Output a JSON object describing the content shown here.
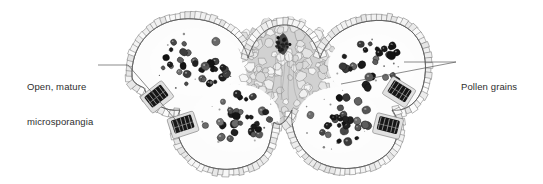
{
  "figure": {
    "type": "light-micrograph",
    "width": 543,
    "height": 184,
    "background_color": "#ffffff"
  },
  "annotations": [
    {
      "id": "open-mature-microsporangia",
      "name": "label-open-mature-microsporangia",
      "lines": [
        "Open, mature",
        "microsporangia"
      ],
      "text": "Open, mature microsporangia",
      "text_x": 27,
      "text_y": 58,
      "leader": {
        "type": "elbow",
        "points": [
          [
            98,
            65
          ],
          [
            128,
            65
          ],
          [
            181,
            126
          ]
        ],
        "color": "#5a5a5a",
        "width": 0.7
      }
    },
    {
      "id": "pollen-grains",
      "name": "label-pollen-grains",
      "lines": [
        "Pollen grains"
      ],
      "text": "Pollen grains",
      "text_x": 461,
      "text_y": 58,
      "leaders": [
        {
          "type": "line",
          "points": [
            [
              404,
              62
            ],
            [
              456,
              62
            ]
          ],
          "color": "#5a5a5a",
          "width": 0.7
        },
        {
          "type": "line",
          "points": [
            [
              341,
              84
            ],
            [
              456,
              62
            ]
          ],
          "color": "#5a5a5a",
          "width": 0.7
        }
      ]
    }
  ],
  "specimen": {
    "outline_color": "#4a4a4a",
    "connective_fill": "#c9c9c9",
    "locule_fill": "#fdfdfd",
    "epidermis_fill": "#efefef",
    "vascular_bundle_color": "#3a3a3a",
    "pollen_color": "#232323",
    "bounds": {
      "x": 128,
      "y": 12,
      "width": 300,
      "height": 165
    },
    "structures": [
      {
        "name": "left-locule",
        "cx": 196,
        "cy": 62,
        "rx": 46,
        "ry": 34
      },
      {
        "name": "left-lower-locule",
        "cx": 236,
        "cy": 118,
        "rx": 44,
        "ry": 34
      },
      {
        "name": "right-upper-locule",
        "cx": 372,
        "cy": 66,
        "rx": 44,
        "ry": 32
      },
      {
        "name": "right-lower-locule",
        "cx": 338,
        "cy": 120,
        "rx": 42,
        "ry": 33
      },
      {
        "name": "connective-tissue",
        "cx": 283,
        "cy": 68,
        "rx": 60,
        "ry": 52
      },
      {
        "name": "vascular-bundle",
        "cx": 283,
        "cy": 44,
        "rx": 9,
        "ry": 11
      }
    ],
    "open_microsporangia": [
      {
        "name": "microsporangium-left-upper",
        "cx": 157,
        "cy": 97,
        "r": 11,
        "rot": -38
      },
      {
        "name": "microsporangium-left-lower",
        "cx": 183,
        "cy": 125,
        "r": 11,
        "rot": -18
      },
      {
        "name": "microsporangium-right-upper",
        "cx": 399,
        "cy": 92,
        "r": 11,
        "rot": 32
      },
      {
        "name": "microsporangium-right-lower",
        "cx": 388,
        "cy": 126,
        "r": 11,
        "rot": 14
      }
    ],
    "pollen_counts": {
      "left_upper_locule": 34,
      "left_lower_locule": 33,
      "right_upper_locule": 30,
      "right_lower_locule": 34
    },
    "seeds": {
      "cells": 20250411,
      "pollen": 77341,
      "wall": 9137
    }
  }
}
